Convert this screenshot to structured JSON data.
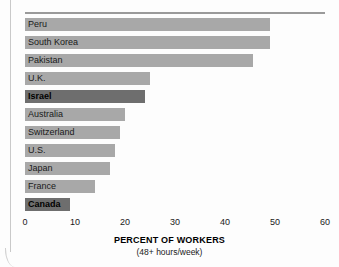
{
  "chart_data": {
    "type": "bar",
    "orientation": "horizontal",
    "title": "",
    "xlabel": "PERCENT OF WORKERS",
    "xlabel_note": "(48+ hours/week)",
    "ylabel": "",
    "xlim": [
      0,
      60
    ],
    "xticks": [
      "0",
      "10",
      "20",
      "30",
      "40",
      "50",
      "60"
    ],
    "grid": false,
    "legend": "none",
    "categories": [
      "Peru",
      "South Korea",
      "Pakistan",
      "U.K.",
      "Israel",
      "Australia",
      "Switzerland",
      "U.S.",
      "Japan",
      "France",
      "Canada"
    ],
    "values": [
      49,
      49,
      45.5,
      25,
      24,
      20,
      19,
      18,
      17,
      14,
      9
    ],
    "highlighted": [
      "Israel",
      "Canada"
    ],
    "colors": {
      "bar": "#a8a8a8",
      "bar_highlight": "#6e6e6e",
      "background": "#fdfdfd",
      "text": "#1a1a1a",
      "rule": "#9a9a9a"
    },
    "bars": [
      {
        "label": "Peru",
        "value": 49,
        "highlight": false
      },
      {
        "label": "South Korea",
        "value": 49,
        "highlight": false
      },
      {
        "label": "Pakistan",
        "value": 45.5,
        "highlight": false
      },
      {
        "label": "U.K.",
        "value": 25,
        "highlight": false
      },
      {
        "label": "Israel",
        "value": 24,
        "highlight": true
      },
      {
        "label": "Australia",
        "value": 20,
        "highlight": false
      },
      {
        "label": "Switzerland",
        "value": 19,
        "highlight": false
      },
      {
        "label": "U.S.",
        "value": 18,
        "highlight": false
      },
      {
        "label": "Japan",
        "value": 17,
        "highlight": false
      },
      {
        "label": "France",
        "value": 14,
        "highlight": false
      },
      {
        "label": "Canada",
        "value": 9,
        "highlight": true
      }
    ]
  }
}
